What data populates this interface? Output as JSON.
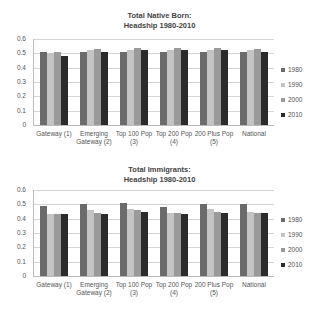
{
  "chart_data": [
    {
      "type": "bar",
      "title": "Total Native Born:\nHeadship 1980-2010",
      "title_lines": [
        "Total Native Born:",
        "Headship 1980-2010"
      ],
      "xlabel": "",
      "ylabel": "",
      "ylim": [
        0,
        0.6
      ],
      "yticks": [
        "0.6",
        "0.5",
        "0.4",
        "0.3",
        "0.2",
        "0.1",
        "0"
      ],
      "grid": true,
      "legend_position": "right",
      "categories": [
        "Gateway  (1)",
        "Emerging Gateway (2)",
        "Top 100 Pop (3)",
        "Top 200 Pop (4)",
        "200 Plus Pop (5)",
        "National"
      ],
      "category_lines": [
        [
          "Gateway  (1)"
        ],
        [
          "Emerging",
          "Gateway (2)"
        ],
        [
          "Top 100 Pop",
          "(3)"
        ],
        [
          "Top 200 Pop",
          "(4)"
        ],
        [
          "200 Plus Pop",
          "(5)"
        ],
        [
          "National"
        ]
      ],
      "series": [
        {
          "name": "1980",
          "color": "#6b6b6b",
          "values": [
            0.51,
            0.51,
            0.51,
            0.51,
            0.51,
            0.51
          ]
        },
        {
          "name": "1990",
          "color": "#c4c4c4",
          "values": [
            0.5,
            0.52,
            0.52,
            0.52,
            0.52,
            0.52
          ]
        },
        {
          "name": "2000",
          "color": "#9a9a9a",
          "values": [
            0.51,
            0.53,
            0.54,
            0.54,
            0.54,
            0.53
          ]
        },
        {
          "name": "2010",
          "color": "#2b2b2b",
          "values": [
            0.48,
            0.51,
            0.52,
            0.52,
            0.52,
            0.51
          ]
        }
      ]
    },
    {
      "type": "bar",
      "title": "Total Immigrants:\nHeadship 1980-2010",
      "title_lines": [
        "Total Immigrants:",
        "Headship 1980-2010"
      ],
      "xlabel": "",
      "ylabel": "",
      "ylim": [
        0,
        0.6
      ],
      "yticks": [
        "0.6",
        "0.5",
        "0.4",
        "0.3",
        "0.2",
        "0.1",
        "0"
      ],
      "grid": true,
      "legend_position": "right",
      "categories": [
        "Gateway  (1)",
        "Emerging Gateway (2)",
        "Top 100 Pop (3)",
        "Top 200 Pop (4)",
        "200 Plus Pop (5)",
        "National"
      ],
      "category_lines": [
        [
          "Gateway  (1)"
        ],
        [
          "Emerging",
          "Gateway (2)"
        ],
        [
          "Top 100 Pop",
          "(3)"
        ],
        [
          "Top 200 Pop",
          "(4)"
        ],
        [
          "200 Plus Pop",
          "(5)"
        ],
        [
          "National"
        ]
      ],
      "series": [
        {
          "name": "1980",
          "color": "#6b6b6b",
          "values": [
            0.49,
            0.5,
            0.51,
            0.48,
            0.5,
            0.5
          ]
        },
        {
          "name": "1990",
          "color": "#c4c4c4",
          "values": [
            0.43,
            0.46,
            0.47,
            0.44,
            0.47,
            0.45
          ]
        },
        {
          "name": "2000",
          "color": "#9a9a9a",
          "values": [
            0.43,
            0.44,
            0.46,
            0.44,
            0.45,
            0.44
          ]
        },
        {
          "name": "2010",
          "color": "#2b2b2b",
          "values": [
            0.43,
            0.43,
            0.45,
            0.43,
            0.44,
            0.44
          ]
        }
      ]
    }
  ]
}
